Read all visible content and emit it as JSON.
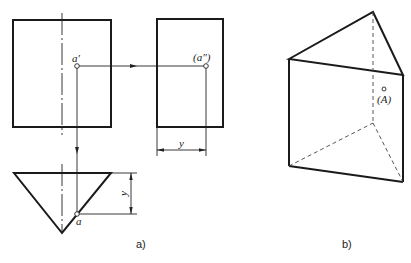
{
  "figure": {
    "panel_a": {
      "caption": "a)",
      "front_view": {
        "type": "rectangle",
        "point_label": "a′"
      },
      "side_view": {
        "type": "rectangle",
        "point_label": "(a″)",
        "dimension_label": "y"
      },
      "top_view": {
        "type": "triangle",
        "point_label": "a",
        "dimension_label": "y"
      }
    },
    "panel_b": {
      "caption": "b)",
      "solid": "triangular prism",
      "point_label": "(A)"
    }
  },
  "colors": {
    "line": "#1a1a1a",
    "background": "#ffffff"
  }
}
